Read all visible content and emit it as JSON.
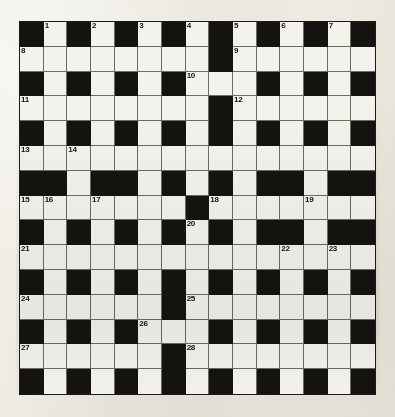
{
  "puzzle": {
    "type": "crossword-grid",
    "rows": 15,
    "columns": 15,
    "colors": {
      "paper": "#efece4",
      "white_cell": "#f4f2ec",
      "black_cell": "#15130f",
      "grid_line": "#6d6a62",
      "number_text": "#131210"
    },
    "grid": [
      [
        "#",
        "1",
        "#",
        "2",
        "#",
        "3",
        "#",
        "4",
        "#",
        "5",
        "#",
        "6",
        "#",
        "7",
        "#"
      ],
      [
        "8",
        "",
        "",
        "",
        "",
        "",
        "",
        "",
        "#",
        "9",
        "",
        "",
        "",
        "",
        ""
      ],
      [
        "#",
        "",
        "#",
        "",
        "#",
        "",
        "#",
        "10",
        "",
        "",
        "#",
        "",
        "#",
        "",
        "#"
      ],
      [
        "11",
        "",
        "",
        "",
        "",
        "",
        "",
        "",
        "#",
        "12",
        "",
        "",
        "",
        "",
        ""
      ],
      [
        "#",
        "",
        "#",
        "",
        "#",
        "",
        "#",
        "",
        "#",
        "",
        "#",
        "",
        "#",
        "",
        "#"
      ],
      [
        "13",
        "",
        "14",
        "",
        "",
        "",
        "",
        "",
        "",
        "",
        "",
        "",
        "",
        "",
        ""
      ],
      [
        "#",
        "#",
        "",
        "#",
        "#",
        "",
        "#",
        "",
        "#",
        "",
        "#",
        "#",
        "",
        "#",
        "#"
      ],
      [
        "15",
        "16",
        "",
        "17",
        "",
        "",
        "",
        "#",
        "18",
        "",
        "",
        "",
        "19",
        "",
        ""
      ],
      [
        "#",
        "",
        "#",
        "",
        "#",
        "",
        "#",
        "20",
        "#",
        "",
        "#",
        "#",
        "",
        "#",
        "#"
      ],
      [
        "21",
        "",
        "",
        "",
        "",
        "",
        "",
        "",
        "",
        "",
        "",
        "22",
        "",
        "23",
        ""
      ],
      [
        "#",
        "",
        "#",
        "",
        "#",
        "",
        "#",
        "",
        "#",
        "",
        "#",
        "",
        "#",
        "",
        "#"
      ],
      [
        "24",
        "",
        "",
        "",
        "",
        "",
        "#",
        "25",
        "",
        "",
        "",
        "",
        "",
        "",
        ""
      ],
      [
        "#",
        "",
        "#",
        "",
        "#",
        "26",
        "",
        "",
        "#",
        "",
        "#",
        "",
        "#",
        "",
        "#"
      ],
      [
        "27",
        "",
        "",
        "",
        "",
        "",
        "#",
        "28",
        "",
        "",
        "",
        "",
        "",
        "",
        ""
      ],
      [
        "#",
        "",
        "#",
        "",
        "#",
        "",
        "#",
        "",
        "#",
        "",
        "#",
        "",
        "#",
        "",
        "#"
      ]
    ],
    "clue_numbers": [
      {
        "number": "1",
        "row": 0,
        "col": 1
      },
      {
        "number": "2",
        "row": 0,
        "col": 3
      },
      {
        "number": "3",
        "row": 0,
        "col": 5
      },
      {
        "number": "4",
        "row": 0,
        "col": 7
      },
      {
        "number": "5",
        "row": 0,
        "col": 9
      },
      {
        "number": "6",
        "row": 0,
        "col": 11
      },
      {
        "number": "7",
        "row": 0,
        "col": 13
      },
      {
        "number": "8",
        "row": 1,
        "col": 0
      },
      {
        "number": "9",
        "row": 1,
        "col": 9
      },
      {
        "number": "10",
        "row": 2,
        "col": 7
      },
      {
        "number": "11",
        "row": 3,
        "col": 0
      },
      {
        "number": "12",
        "row": 3,
        "col": 9
      },
      {
        "number": "13",
        "row": 5,
        "col": 0
      },
      {
        "number": "14",
        "row": 5,
        "col": 2
      },
      {
        "number": "15",
        "row": 7,
        "col": 0
      },
      {
        "number": "16",
        "row": 7,
        "col": 1
      },
      {
        "number": "17",
        "row": 7,
        "col": 3
      },
      {
        "number": "18",
        "row": 7,
        "col": 8
      },
      {
        "number": "19",
        "row": 7,
        "col": 12
      },
      {
        "number": "20",
        "row": 8,
        "col": 7
      },
      {
        "number": "21",
        "row": 9,
        "col": 0
      },
      {
        "number": "22",
        "row": 9,
        "col": 11
      },
      {
        "number": "23",
        "row": 9,
        "col": 13
      },
      {
        "number": "24",
        "row": 11,
        "col": 0
      },
      {
        "number": "25",
        "row": 11,
        "col": 7
      },
      {
        "number": "26",
        "row": 12,
        "col": 5
      },
      {
        "number": "27",
        "row": 13,
        "col": 0
      },
      {
        "number": "28",
        "row": 13,
        "col": 7
      }
    ]
  }
}
